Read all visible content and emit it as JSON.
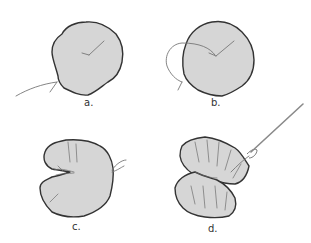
{
  "figure": {
    "colors": {
      "fabric_fill": "#d6d6d6",
      "outline": "#333333",
      "thread": "#777777",
      "background": "#ffffff"
    },
    "steps": [
      {
        "id": "a",
        "label": "a.",
        "caption_pos": [
          86,
          98
        ]
      },
      {
        "id": "b",
        "label": "b.",
        "caption_pos": [
          213,
          98
        ]
      },
      {
        "id": "c",
        "label": "c.",
        "caption_pos": [
          73,
          222
        ]
      },
      {
        "id": "d",
        "label": "d.",
        "caption_pos": [
          209,
          224
        ]
      }
    ]
  }
}
